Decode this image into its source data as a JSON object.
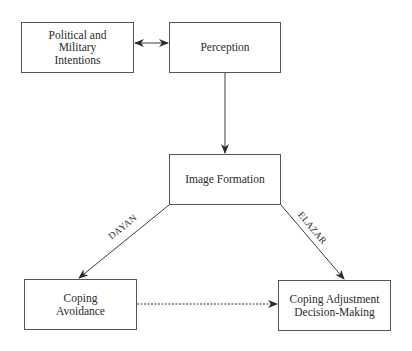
{
  "diagram": {
    "nodes": [
      {
        "id": "political",
        "label": "Political and\nMilitary\nIntentions",
        "x": 21,
        "y": 22,
        "w": 113,
        "h": 51
      },
      {
        "id": "perception",
        "label": "Perception",
        "x": 169,
        "y": 22,
        "w": 112,
        "h": 51
      },
      {
        "id": "image",
        "label": "Image Formation",
        "x": 169,
        "y": 154,
        "w": 112,
        "h": 51
      },
      {
        "id": "avoidance",
        "label": "Coping\nAvoidance",
        "x": 24,
        "y": 279,
        "w": 113,
        "h": 51
      },
      {
        "id": "adjustment",
        "label": "Coping Adjustment\nDecision-Making",
        "x": 278,
        "y": 280,
        "w": 113,
        "h": 51
      }
    ],
    "edges": [
      {
        "from": "political",
        "to": "perception",
        "style": "solid",
        "arrows": "both"
      },
      {
        "from": "perception",
        "to": "image",
        "style": "solid",
        "arrows": "end"
      },
      {
        "from": "image",
        "to": "avoidance",
        "style": "solid",
        "arrows": "end",
        "label": "DAYAN"
      },
      {
        "from": "image",
        "to": "adjustment",
        "style": "solid",
        "arrows": "end",
        "label": "ELAZAR"
      },
      {
        "from": "avoidance",
        "to": "adjustment",
        "style": "dashed",
        "arrows": "end"
      }
    ],
    "labels": {
      "political": "Political and\nMilitary\nIntentions",
      "perception": "Perception",
      "image": "Image Formation",
      "avoidance": "Coping\nAvoidance",
      "adjustment": "Coping Adjustment\nDecision-Making",
      "dayan": "DAYAN",
      "elazar": "ELAZAR"
    },
    "colors": {
      "line": "#3a3a3a",
      "border": "#555555",
      "text": "#2a2a2a"
    }
  }
}
